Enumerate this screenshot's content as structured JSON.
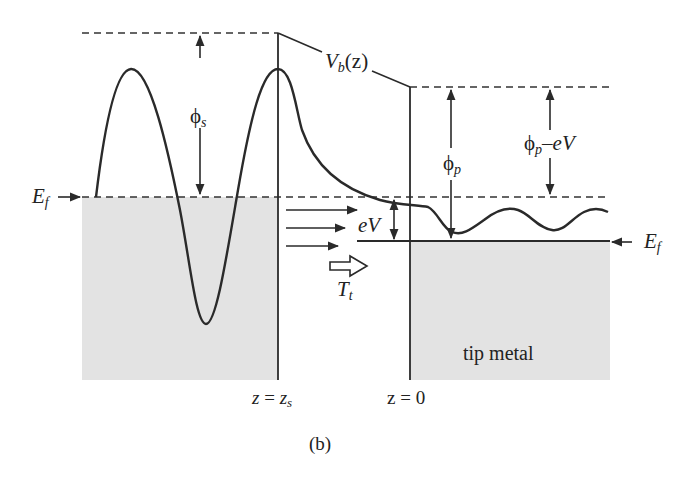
{
  "figure": {
    "panel_label": "(b)",
    "colors": {
      "background": "#ffffff",
      "region_fill": "#e3e3e3",
      "line": "#2a2a2a"
    }
  },
  "labels": {
    "barrier_potential": {
      "main": "V",
      "sub": "b",
      "arg": "(z)"
    },
    "sample_work_function": {
      "main": "ϕ",
      "sub": "s"
    },
    "tip_work_function": {
      "main": "ϕ",
      "sub": "p"
    },
    "tip_work_function_minus_bias": {
      "main": "ϕ",
      "sub": "p",
      "rest": "–eV"
    },
    "bias_energy": "eV",
    "fermi_left": {
      "main": "E",
      "sub": "f"
    },
    "fermi_right": {
      "main": "E",
      "sub": "f"
    },
    "transmission": {
      "main": "T",
      "sub": "t"
    },
    "tip_region": "tip metal",
    "sample_surface_position": {
      "lhs": "z",
      "eq": " = ",
      "rhs": "z",
      "sub": "s"
    },
    "tip_position": "z = 0"
  },
  "elements": {
    "tunneling_arrows_count": 3,
    "hollow_arrow": "transmission-direction"
  }
}
